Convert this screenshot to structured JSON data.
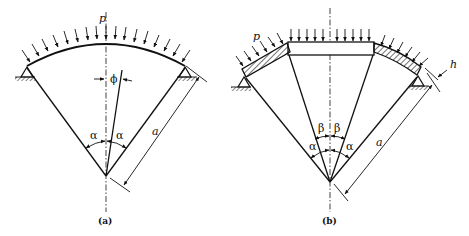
{
  "figure": {
    "panels": [
      {
        "id": "a",
        "caption": "(a)",
        "labels": {
          "load": "p",
          "angle_left": "α",
          "angle_right": "α",
          "angle_phi": "ϕ",
          "radius": "a"
        },
        "description": "Circular arch segment of half-angle α under uniform radial pressure p, pinned supports at both ends"
      },
      {
        "id": "b",
        "caption": "(b)",
        "labels": {
          "load": "p",
          "angle_inner_left": "β",
          "angle_inner_right": "β",
          "angle_outer_left": "α",
          "angle_outer_right": "α",
          "radius": "a",
          "thickness": "h"
        },
        "description": "Segmented arch: rigid central block over angle 2β, hatched curved end segments, pinned supports, thickness h"
      }
    ]
  }
}
